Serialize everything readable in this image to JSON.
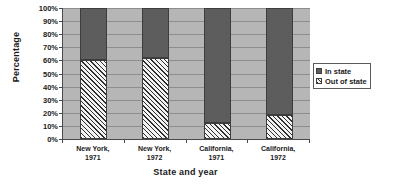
{
  "chart_data": {
    "type": "bar",
    "subtype": "100% stacked column",
    "title": "",
    "xlabel": "State and year",
    "ylabel": "Percentage",
    "categories": [
      "New York, 1971",
      "New York, 1972",
      "California, 1971",
      "California, 1972"
    ],
    "category_lines": [
      [
        "New York,",
        "1971"
      ],
      [
        "New York,",
        "1972"
      ],
      [
        "California,",
        "1971"
      ],
      [
        "California,",
        "1972"
      ]
    ],
    "series": [
      {
        "name": "In state",
        "values": [
          40,
          38,
          88,
          82
        ],
        "color": "#5d5d5d",
        "pattern": "solid"
      },
      {
        "name": "Out of state",
        "values": [
          60,
          62,
          12,
          18
        ],
        "color": "#f2f2f2",
        "pattern": "diagonal-hatch"
      }
    ],
    "stack_order": [
      "Out of state",
      "In state"
    ],
    "ylim": [
      0,
      100
    ],
    "ytick_step": 10,
    "ytick_labels": [
      "0%",
      "10%",
      "20%",
      "30%",
      "40%",
      "50%",
      "60%",
      "70%",
      "80%",
      "90%",
      "100%"
    ],
    "ytick_values": [
      0,
      10,
      20,
      30,
      40,
      50,
      60,
      70,
      80,
      90,
      100
    ],
    "grid": true,
    "legend_position": "right",
    "plot_background": "#b6b6b6"
  },
  "legend": {
    "items": [
      {
        "label": "In state"
      },
      {
        "label": "Out of state"
      }
    ]
  }
}
